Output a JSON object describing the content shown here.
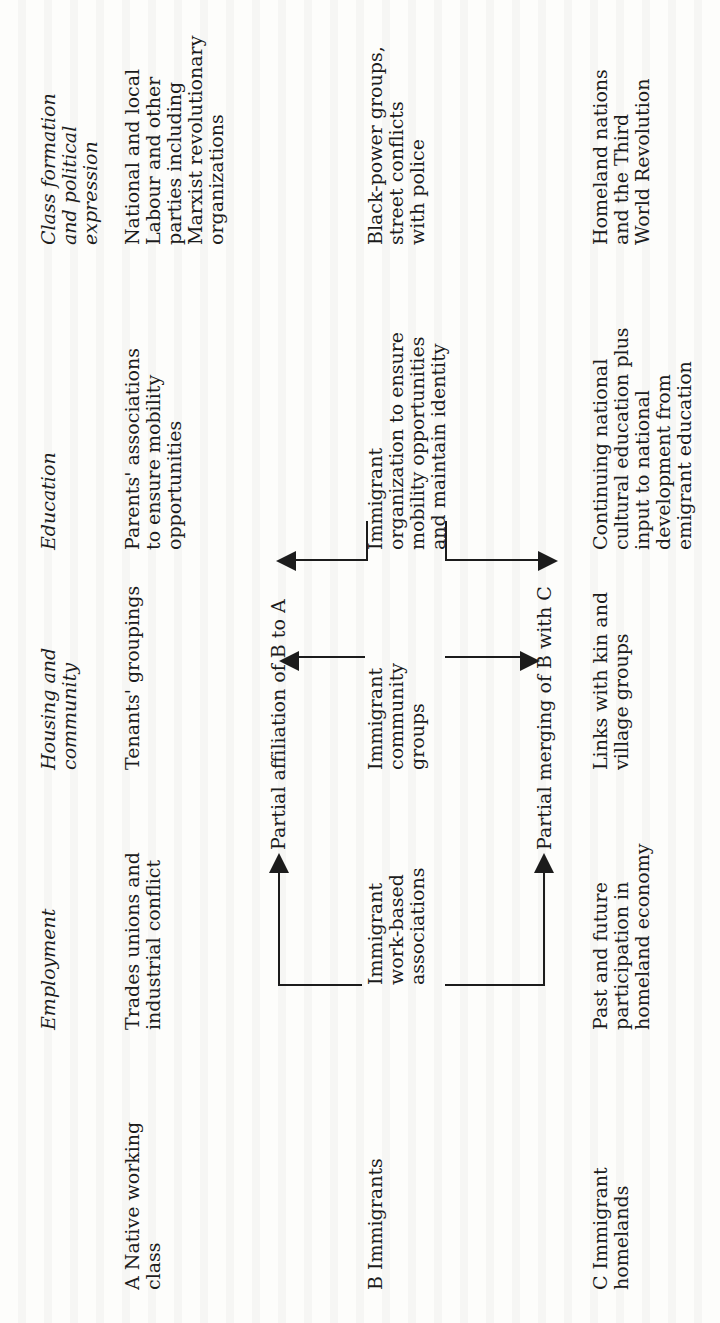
{
  "table": {
    "column_headers": [
      "Employment",
      "Housing and\ncommunity",
      "Education",
      "Class formation\nand political\nexpression"
    ],
    "rows": [
      {
        "label": "A  Native working\n    class",
        "cells": [
          "Trades unions and\nindustrial conflict",
          "Tenants' groupings",
          "Parents' associations\nto ensure mobility\nopportunities",
          "National and local\nLabour and other\nparties including\nMarxist revolutionary\norganizations"
        ]
      },
      {
        "label": "B  Immigrants",
        "cells": [
          "Immigrant\nwork-based\nassociations",
          "Immigrant\ncommunity\ngroups",
          "Immigrant\norganization to ensure\nmobility opportunities\nand maintain identity",
          "Black-power groups,\nstreet conflicts\nwith police"
        ]
      },
      {
        "label": "C  Immigrant\n    homelands",
        "cells": [
          "Past and future\nparticipation in\nhomeland economy",
          "Links with kin and\nvillage groups",
          "Continuing national\ncultural education plus\ninput to national\ndevelopment from\nemigrant education",
          "Homeland nations\nand the Third\nWorld Revolution"
        ]
      }
    ],
    "connectors": {
      "b_to_a": "Partial affiliation of B to A",
      "b_with_c": "Partial merging of B with C"
    }
  }
}
